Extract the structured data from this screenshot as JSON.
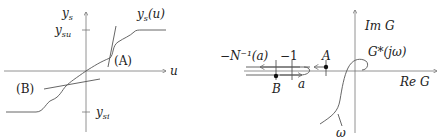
{
  "left_panel": {
    "x_axis_label": "u",
    "y_axis_label_base": "y",
    "y_axis_label_sub": "s",
    "curve_label": "y_s(u)",
    "curve_label_base": "y",
    "curve_label_sub": "s",
    "curve_label_arg": "(u)",
    "upper_tick_label_base": "y",
    "upper_tick_label_sub": "su",
    "lower_tick_label_base": "y",
    "lower_tick_label_sub": "si",
    "tangent_a_label": "(A)",
    "tangent_b_label": "(B)"
  },
  "right_panel": {
    "imag_axis_label": "Im G",
    "real_axis_label": "Re G",
    "curve_label": "G*(jω)",
    "omega_label": "ω",
    "neg_inverse_label": "−N⁻¹(a)",
    "minus_one_label": "−1",
    "point_a_label": "A",
    "point_b_label": "B",
    "a_arrow_label": "a"
  }
}
